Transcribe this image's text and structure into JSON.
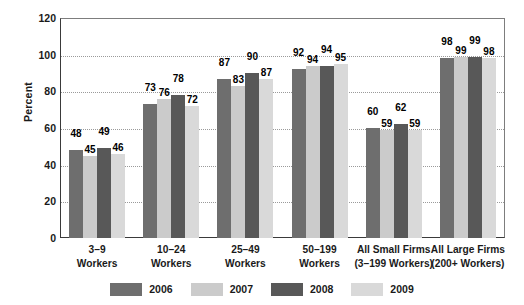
{
  "chart_data": {
    "type": "bar",
    "title": "",
    "subtitle": "",
    "xlabel": "",
    "ylabel": "Percent",
    "ylim": [
      0,
      120
    ],
    "yticks": [
      0,
      20,
      40,
      60,
      80,
      100,
      120
    ],
    "grid": true,
    "legend_position": "bottom",
    "categories": [
      {
        "line1": "3–9",
        "line2": "Workers"
      },
      {
        "line1": "10–24",
        "line2": "Workers"
      },
      {
        "line1": "25–49",
        "line2": "Workers"
      },
      {
        "line1": "50–199",
        "line2": "Workers"
      },
      {
        "line1": "All Small Firms",
        "line2": "(3–199 Workers)"
      },
      {
        "line1": "All Large Firms",
        "line2": "(200+ Workers)"
      }
    ],
    "series": [
      {
        "name": "2006",
        "color": "#6e6e6e",
        "values": [
          48,
          73,
          87,
          92,
          60,
          98
        ]
      },
      {
        "name": "2007",
        "color": "#cbcbcb",
        "values": [
          45,
          76,
          83,
          94,
          59,
          99
        ]
      },
      {
        "name": "2008",
        "color": "#585858",
        "values": [
          49,
          78,
          90,
          94,
          62,
          99
        ]
      },
      {
        "name": "2009",
        "color": "#d9d9d9",
        "values": [
          46,
          72,
          87,
          95,
          59,
          98
        ]
      }
    ]
  }
}
